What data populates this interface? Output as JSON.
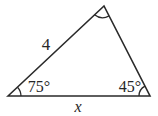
{
  "diagram": {
    "type": "triangle-figure",
    "side_labels": {
      "left_side": "4",
      "bottom_side": "x"
    },
    "angle_labels": {
      "bottom_left": "75°",
      "bottom_right": "45°",
      "top": ""
    },
    "arcs": {
      "bottom_left": true,
      "bottom_right": true,
      "top": true
    },
    "colors": {
      "line": "#2a2a2a",
      "background": "#ffffff"
    }
  }
}
